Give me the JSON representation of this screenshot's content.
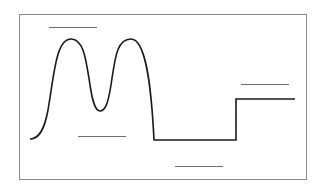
{
  "diagram": {
    "type": "waveform-with-blank-labels",
    "colors": {
      "frame": "#8a8a8a",
      "curve": "#1a1a1a",
      "label_line": "#6e6e6e",
      "background": "#ffffff"
    },
    "frame": {
      "x": 19,
      "y": 14,
      "width": 287,
      "height": 165
    },
    "curve_path": "M30,139 C38,139 44,132 48,110 C54,75 56,39 71,39 C84,39 86,60 90,85 C93,105 96,111 100,111 C105,111 108,104 111,85 C115,60 116,39 131,39 C145,39 151,80 154,140 L236,140 L236,99 L295,99",
    "blank_labels": [
      {
        "name": "label-blank-top-left",
        "x1": 49,
        "x2": 97,
        "y": 27
      },
      {
        "name": "label-blank-trough",
        "x1": 78,
        "x2": 126,
        "y": 136
      },
      {
        "name": "label-blank-bottom-middle",
        "x1": 175,
        "x2": 223,
        "y": 166
      },
      {
        "name": "label-blank-right",
        "x1": 241,
        "x2": 289,
        "y": 84
      }
    ]
  }
}
